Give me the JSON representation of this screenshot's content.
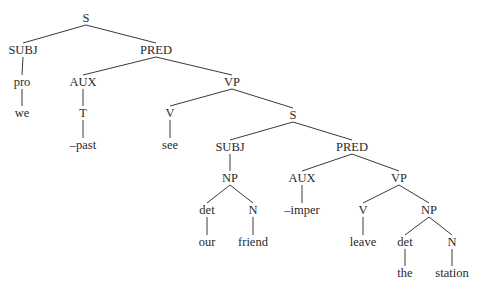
{
  "diagram": {
    "type": "syntax-tree",
    "nodes": [
      {
        "id": "S1",
        "label": "S",
        "x": 86,
        "y": 18
      },
      {
        "id": "SUBJ1",
        "label": "SUBJ",
        "x": 23,
        "y": 50
      },
      {
        "id": "PRED1",
        "label": "PRED",
        "x": 156,
        "y": 50
      },
      {
        "id": "pro",
        "label": "pro",
        "x": 22,
        "y": 82
      },
      {
        "id": "we",
        "label": "we",
        "x": 22,
        "y": 113
      },
      {
        "id": "AUX1",
        "label": "AUX",
        "x": 83,
        "y": 82
      },
      {
        "id": "T",
        "label": "T",
        "x": 83,
        "y": 113
      },
      {
        "id": "past",
        "label": "–past",
        "x": 83,
        "y": 145
      },
      {
        "id": "VP1",
        "label": "VP",
        "x": 232,
        "y": 82
      },
      {
        "id": "V1",
        "label": "V",
        "x": 170,
        "y": 113
      },
      {
        "id": "see",
        "label": "see",
        "x": 170,
        "y": 145
      },
      {
        "id": "S2",
        "label": "S",
        "x": 293,
        "y": 115
      },
      {
        "id": "SUBJ2",
        "label": "SUBJ",
        "x": 230,
        "y": 147
      },
      {
        "id": "NP1",
        "label": "NP",
        "x": 230,
        "y": 178
      },
      {
        "id": "det1",
        "label": "det",
        "x": 207,
        "y": 210
      },
      {
        "id": "our",
        "label": "our",
        "x": 207,
        "y": 242
      },
      {
        "id": "N1",
        "label": "N",
        "x": 253,
        "y": 210
      },
      {
        "id": "friend",
        "label": "friend",
        "x": 253,
        "y": 242
      },
      {
        "id": "PRED2",
        "label": "PRED",
        "x": 352,
        "y": 147
      },
      {
        "id": "AUX2",
        "label": "AUX",
        "x": 302,
        "y": 178
      },
      {
        "id": "imper",
        "label": "–imper",
        "x": 302,
        "y": 210
      },
      {
        "id": "VP2",
        "label": "VP",
        "x": 399,
        "y": 178
      },
      {
        "id": "V2",
        "label": "V",
        "x": 363,
        "y": 210
      },
      {
        "id": "leave",
        "label": "leave",
        "x": 363,
        "y": 242
      },
      {
        "id": "NP2",
        "label": "NP",
        "x": 429,
        "y": 210
      },
      {
        "id": "det2",
        "label": "det",
        "x": 405,
        "y": 242
      },
      {
        "id": "the",
        "label": "the",
        "x": 405,
        "y": 273
      },
      {
        "id": "N2",
        "label": "N",
        "x": 452,
        "y": 242
      },
      {
        "id": "station",
        "label": "station",
        "x": 452,
        "y": 273
      }
    ],
    "edges": [
      [
        "S1",
        "SUBJ1"
      ],
      [
        "S1",
        "PRED1"
      ],
      [
        "SUBJ1",
        "pro"
      ],
      [
        "pro",
        "we"
      ],
      [
        "PRED1",
        "AUX1"
      ],
      [
        "PRED1",
        "VP1"
      ],
      [
        "AUX1",
        "T"
      ],
      [
        "T",
        "past"
      ],
      [
        "VP1",
        "V1"
      ],
      [
        "VP1",
        "S2"
      ],
      [
        "V1",
        "see"
      ],
      [
        "S2",
        "SUBJ2"
      ],
      [
        "S2",
        "PRED2"
      ],
      [
        "SUBJ2",
        "NP1"
      ],
      [
        "NP1",
        "det1"
      ],
      [
        "NP1",
        "N1"
      ],
      [
        "det1",
        "our"
      ],
      [
        "N1",
        "friend"
      ],
      [
        "PRED2",
        "AUX2"
      ],
      [
        "PRED2",
        "VP2"
      ],
      [
        "AUX2",
        "imper"
      ],
      [
        "VP2",
        "V2"
      ],
      [
        "VP2",
        "NP2"
      ],
      [
        "V2",
        "leave"
      ],
      [
        "NP2",
        "det2"
      ],
      [
        "NP2",
        "N2"
      ],
      [
        "det2",
        "the"
      ],
      [
        "N2",
        "station"
      ]
    ],
    "colors": {
      "text": "#2a2a2a",
      "line": "#3a3a3a",
      "background": "#ffffff"
    }
  }
}
